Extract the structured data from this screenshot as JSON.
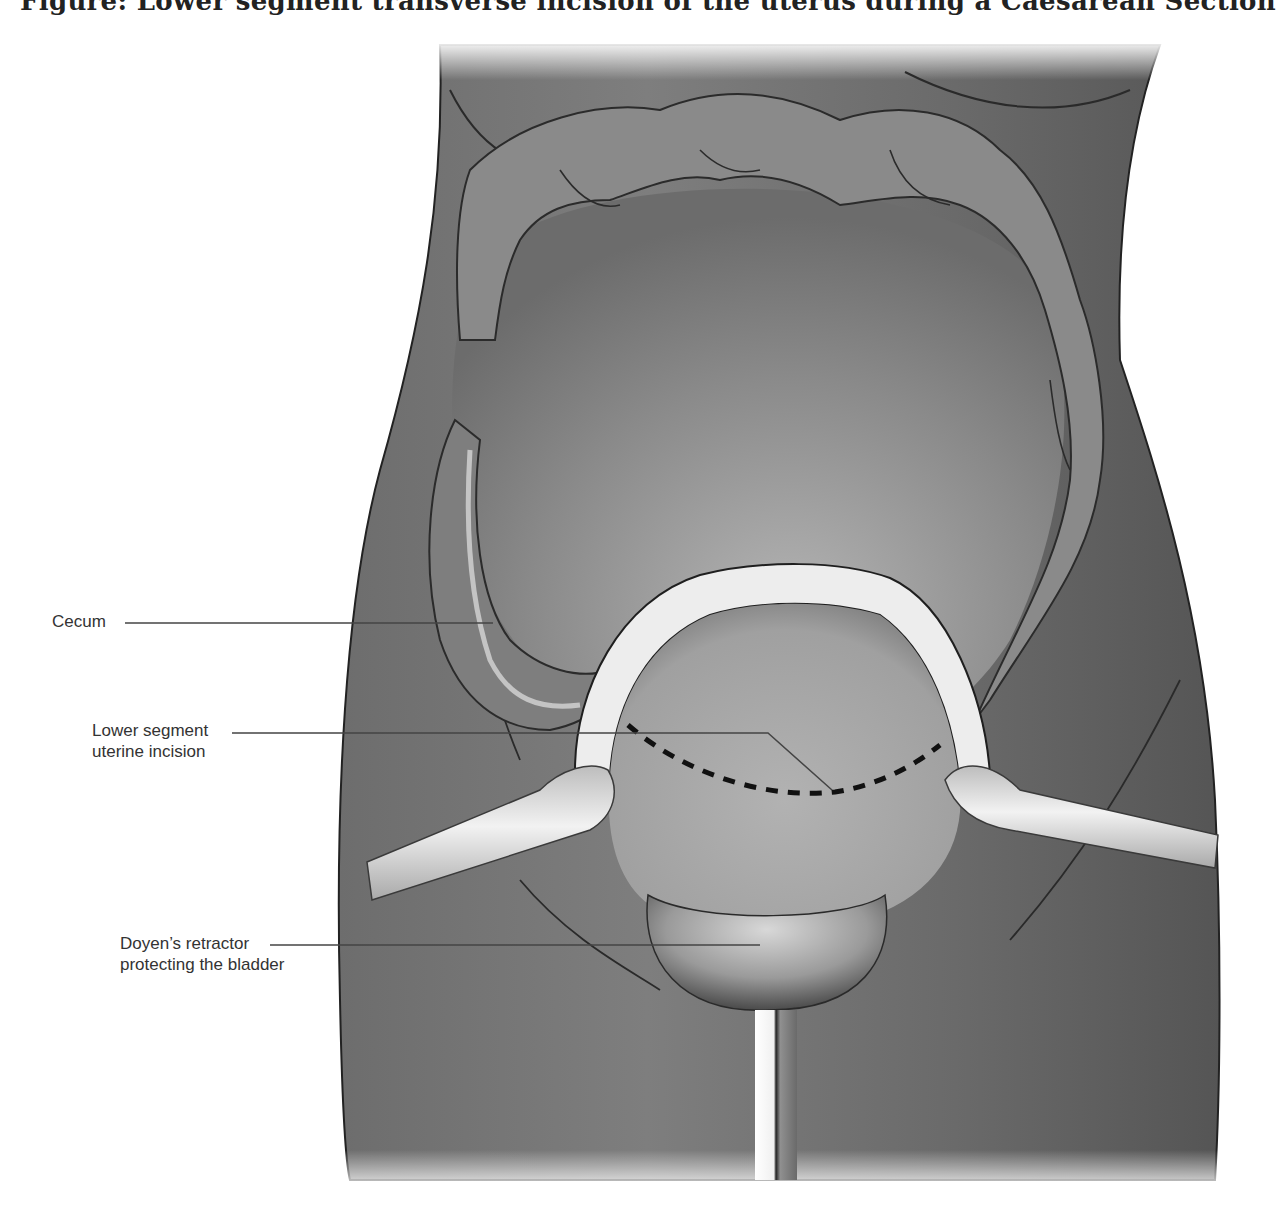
{
  "figure": {
    "title": "Figure: Lower segment transverse incision of the uterus during a Caesarean Section",
    "labels": [
      {
        "id": "cecum",
        "lines": [
          "Cecum"
        ]
      },
      {
        "id": "incision",
        "lines": [
          "Lower segment",
          "uterine incision"
        ]
      },
      {
        "id": "retractor",
        "lines": [
          "Doyen’s retractor",
          "protecting the bladder"
        ]
      }
    ],
    "colors": {
      "skin": "#7a7a7a",
      "skin_dark": "#5e5e5e",
      "bowel": "#8c8c8c",
      "uterus": "#a8a8a8",
      "peritoneum_edge": "#eeeeee",
      "instrument": "#e4e4e4",
      "outline": "#2a2a2a",
      "leader_line": "#444444"
    }
  }
}
